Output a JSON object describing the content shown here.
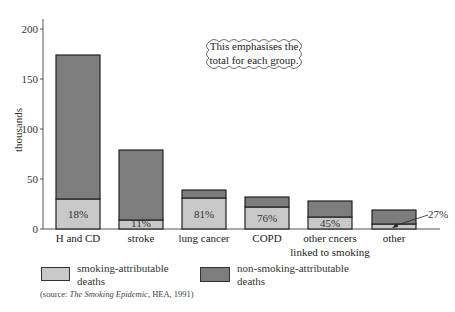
{
  "chart_data": {
    "type": "bar",
    "stacked": true,
    "title": "",
    "xlabel": "",
    "ylabel": "thousands",
    "ylim": [
      0,
      220
    ],
    "yticks": [
      0,
      50,
      100,
      150,
      200
    ],
    "grid": false,
    "categories": [
      "H and CD",
      "stroke",
      "lung cancer",
      "COPD",
      "other cncers linked to smoking",
      "other"
    ],
    "category_lines": [
      [
        "H and CD"
      ],
      [
        "stroke"
      ],
      [
        "lung cancer"
      ],
      [
        "COPD"
      ],
      [
        "other cncers",
        "linked to smoking"
      ],
      [
        "other"
      ]
    ],
    "series": [
      {
        "name": "smoking-attributable deaths",
        "color": "#c8c8c8",
        "values": [
          30,
          9,
          31,
          22,
          12,
          5
        ]
      },
      {
        "name": "non-smoking-attributable deaths",
        "color": "#7d7d7d",
        "values": [
          144,
          70,
          8,
          10,
          16,
          14
        ]
      }
    ],
    "totals": [
      174,
      79,
      39,
      32,
      28,
      19
    ],
    "percent_labels": [
      "18%",
      "11%",
      "81%",
      "76%",
      "45%",
      "27%"
    ],
    "annotation": "This emphasises the total for each group.",
    "legend_position": "bottom",
    "source": {
      "prefix": "(source: ",
      "title": "The Smoking Epidemic",
      "suffix": ", HEA, 1991)"
    }
  },
  "labels": {
    "ylabel": "thousands",
    "annotation_line1": "This emphasises the",
    "annotation_line2": "total for each group.",
    "legend_smoking_line1": "smoking-attributable",
    "legend_smoking_line2": "deaths",
    "legend_non_line1": "non-smoking-attributable",
    "legend_non_line2": "deaths",
    "source_prefix": "(source: ",
    "source_title": "The Smoking Epidemic",
    "source_suffix": ", HEA, 1991)"
  }
}
